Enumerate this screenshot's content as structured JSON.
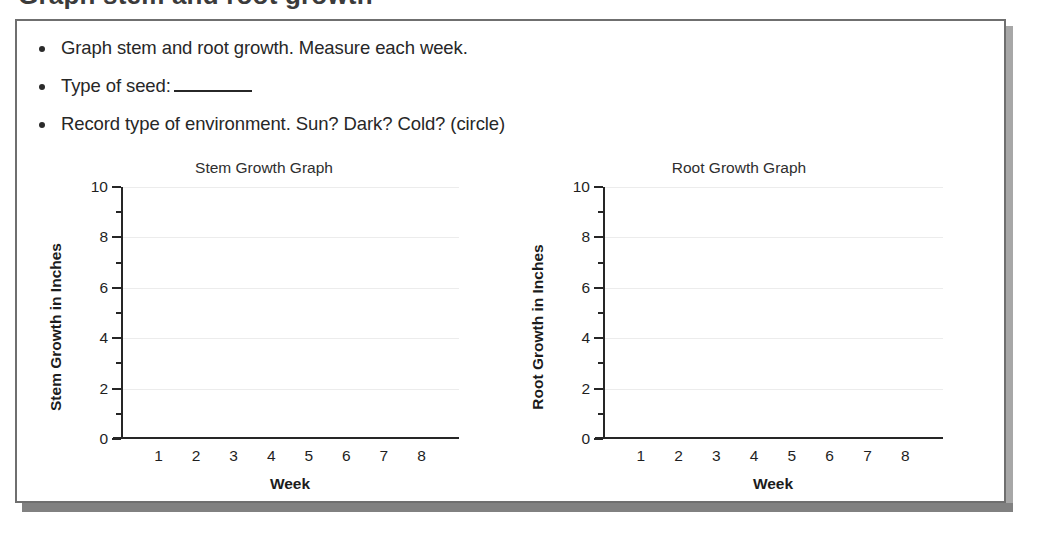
{
  "heading_partial": "Graph stem and root growth",
  "instructions": [
    {
      "text_before": "Graph stem and root growth. Measure each week.",
      "has_blank": false,
      "text_after": ""
    },
    {
      "text_before": "Type of seed:",
      "has_blank": true,
      "text_after": ""
    },
    {
      "text_before": "Record type of environment. Sun? Dark? Cold? (circle)",
      "has_blank": false,
      "text_after": ""
    }
  ],
  "chart_data": [
    {
      "type": "line",
      "title": "Stem Growth Graph",
      "xlabel": "Week",
      "ylabel": "Stem Growth in Inches",
      "categories": [
        "1",
        "2",
        "3",
        "4",
        "5",
        "6",
        "7",
        "8"
      ],
      "x": [
        1,
        2,
        3,
        4,
        5,
        6,
        7,
        8
      ],
      "series": [
        {
          "name": "Stem Growth",
          "values": []
        }
      ],
      "values": [],
      "y_ticks": [
        "10",
        "8",
        "6",
        "4",
        "2",
        "0"
      ],
      "y_minor_ticks": [
        9,
        7,
        5,
        3,
        1
      ],
      "ylim": [
        0,
        10
      ],
      "xlim": [
        0,
        9
      ],
      "grid": true,
      "legend": "none",
      "note": "Blank worksheet grid - no data plotted"
    },
    {
      "type": "line",
      "title": "Root Growth Graph",
      "xlabel": "Week",
      "ylabel": "Root Growth in Inches",
      "categories": [
        "1",
        "2",
        "3",
        "4",
        "5",
        "6",
        "7",
        "8"
      ],
      "x": [
        1,
        2,
        3,
        4,
        5,
        6,
        7,
        8
      ],
      "series": [
        {
          "name": "Root Growth",
          "values": []
        }
      ],
      "values": [],
      "y_ticks": [
        "10",
        "8",
        "6",
        "4",
        "2",
        "0"
      ],
      "y_minor_ticks": [
        9,
        7,
        5,
        3,
        1
      ],
      "ylim": [
        0,
        10
      ],
      "xlim": [
        0,
        9
      ],
      "grid": true,
      "legend": "none",
      "note": "Blank worksheet grid - no data plotted"
    }
  ],
  "colors": {
    "panel_border": "#6f6f6f",
    "panel_shadow": "#818181",
    "axis": "#262626",
    "gridline": "#ececec",
    "text": "#272727"
  }
}
